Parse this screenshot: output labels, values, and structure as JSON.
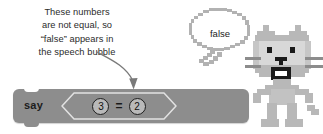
{
  "caption": {
    "lines": [
      "These numbers",
      "are not equal, so",
      "“false” appears in",
      "the speech bubble"
    ],
    "text_color": "#2b2b2b"
  },
  "arrow": {
    "name": "curved-pointer-arrow",
    "color": "#7a7a7a",
    "points_to": "equals-operator"
  },
  "say_block": {
    "label": "say",
    "block_color": "#8d8d8d",
    "text_color": "#1c1c1c"
  },
  "equals_operator": {
    "left_operand": "3",
    "right_operand": "2",
    "operator": "=",
    "outline_color": "#e0e0e0",
    "bubble_fill": "#b9b9b9",
    "bubble_border": "#1e1e1e"
  },
  "speech_bubble": {
    "text": "false",
    "outline_color": "#b2b2b2",
    "fill_color": "#ffffff",
    "text_color": "#1b1b1b"
  },
  "cat_sprite": {
    "name": "scratch-cat",
    "body_color": "#b8b8b8",
    "outline_color": "#9a9a9a",
    "face_color": "#d8d8d8",
    "detail_color": "#1a1a1a"
  },
  "background": {
    "color": "#ffffff"
  }
}
